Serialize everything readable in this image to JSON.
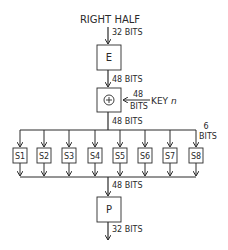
{
  "diagram": {
    "input_label": "RIGHT HALF",
    "colors": {
      "stroke": "#2a2a2a",
      "background": "#ffffff"
    },
    "blocks": {
      "expansion": {
        "label": "E"
      },
      "xor": {
        "symbol": "⊕"
      },
      "permutation": {
        "label": "P"
      }
    },
    "edges": {
      "input_to_e": "32 BITS",
      "e_to_xor": "48 BITS",
      "key_width_top": "48",
      "key_width_bottom": "BITS",
      "key_label": "KEY ",
      "key_index": "n",
      "xor_to_sboxes": "48 BITS",
      "sbox_width_top": "6",
      "sbox_width_bottom": "BITS",
      "sboxes_to_p": "48 BITS",
      "p_output": "32 BITS"
    },
    "sboxes": [
      {
        "label": "S1"
      },
      {
        "label": "S2"
      },
      {
        "label": "S3"
      },
      {
        "label": "S4"
      },
      {
        "label": "S5"
      },
      {
        "label": "S6"
      },
      {
        "label": "S7"
      },
      {
        "label": "S8"
      }
    ]
  }
}
